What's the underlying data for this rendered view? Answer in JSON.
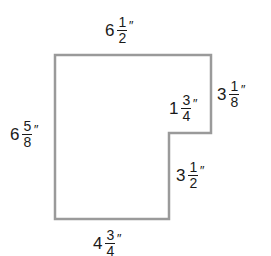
{
  "diagram": {
    "type": "l-shaped-polygon",
    "stroke_color": "#9a9a9a",
    "vertices": [
      [
        55,
        55
      ],
      [
        211,
        55
      ],
      [
        211,
        133
      ],
      [
        169,
        133
      ],
      [
        169,
        219
      ],
      [
        55,
        219
      ]
    ],
    "labels": {
      "top": {
        "whole": "6",
        "num": "1",
        "den": "2",
        "unit": "″"
      },
      "left": {
        "whole": "6",
        "num": "5",
        "den": "8",
        "unit": "″"
      },
      "right_upper": {
        "whole": "3",
        "num": "1",
        "den": "8",
        "unit": "″"
      },
      "step": {
        "whole": "1",
        "num": "3",
        "den": "4",
        "unit": "″"
      },
      "right_lower": {
        "whole": "3",
        "num": "1",
        "den": "2",
        "unit": "″"
      },
      "bottom": {
        "whole": "4",
        "num": "3",
        "den": "4",
        "unit": "″"
      }
    }
  }
}
